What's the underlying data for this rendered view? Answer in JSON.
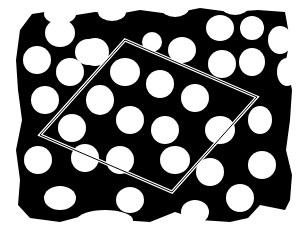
{
  "image": {
    "description": "Binary micrograph of a hexagonal lattice of white roughly round domains on a black matrix, with a double-line rhombus outlining a unit cell",
    "colors": {
      "background": "#ffffff",
      "matrix": "#000000",
      "domains": "#ffffff",
      "outline": "#ffffff"
    },
    "unit_cell": {
      "vertices": [
        [
          125,
          40
        ],
        [
          257,
          97
        ],
        [
          172,
          192
        ],
        [
          40,
          135
        ]
      ],
      "style": "double white line"
    }
  }
}
